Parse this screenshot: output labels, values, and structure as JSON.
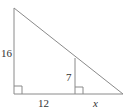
{
  "diagram": {
    "type": "similar-right-triangles",
    "stroke_color": "#8a8a8a",
    "text_color": "#333333",
    "outer_triangle": {
      "vertices": {
        "top": [
          14,
          8
        ],
        "bottom_left": [
          14,
          94
        ],
        "bottom_right": [
          123,
          94
        ]
      },
      "right_angle_at": "bottom_left"
    },
    "inner_segment": {
      "from": [
        75,
        94
      ],
      "to": [
        75,
        58
      ],
      "right_angle_at": "base"
    },
    "labels": {
      "outer_height": "16",
      "inner_height": "7",
      "left_base": "12",
      "right_base": "x"
    }
  }
}
